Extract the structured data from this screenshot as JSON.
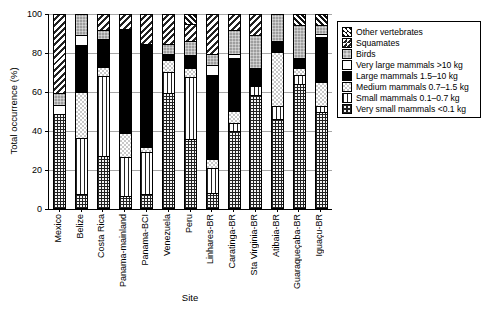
{
  "chart_data": {
    "type": "bar",
    "stacked": true,
    "percent": true,
    "title": "",
    "xlabel": "Site",
    "ylabel": "Total occurrence (%)",
    "ylim": [
      0,
      100
    ],
    "yticks": [
      0,
      20,
      40,
      60,
      80,
      100
    ],
    "grid": true,
    "legend_position": "top-right",
    "categories": [
      "Mexico",
      "Belize",
      "Costa Rica",
      "Panama-mainland",
      "Panama-BCI",
      "Venezuela",
      "Peru",
      "Linhares-BR",
      "Caratinga-BR",
      "Sta Virginia-BR",
      "Atibaia-BR",
      "Guaraqueçaba-BR",
      "Iguaçu-BR"
    ],
    "series": [
      {
        "key": "very_small",
        "name": "Very small mammals <0.1 kg",
        "pattern": "dense-grid-crosshatch",
        "values": [
          48.5,
          7,
          27,
          6,
          7,
          59.5,
          35.5,
          7.5,
          40,
          58.5,
          46,
          64,
          49.5
        ]
      },
      {
        "key": "small",
        "name": "Small mammals 0.1–0.7 kg",
        "pattern": "vertical-lines",
        "values": [
          0,
          29,
          41.5,
          20.5,
          22,
          11,
          32.5,
          13,
          4,
          4.5,
          7,
          5,
          3.5
        ]
      },
      {
        "key": "medium",
        "name": "Medium mammals 0.7–1.5 kg",
        "pattern": "light-checker",
        "values": [
          0,
          24,
          4.5,
          12.5,
          2.5,
          6,
          4.5,
          5,
          6,
          0,
          28,
          3.5,
          12.5
        ]
      },
      {
        "key": "large",
        "name": "Large mammals 1.5–10 kg",
        "pattern": "solid-black",
        "color": "#000000",
        "values": [
          0,
          24.5,
          14.5,
          53.5,
          53.5,
          3.5,
          7,
          43.5,
          27.5,
          9.5,
          5.5,
          5,
          23
        ]
      },
      {
        "key": "very_large",
        "name": "Very large mammals >10 kg",
        "pattern": "solid-white",
        "color": "#ffffff",
        "values": [
          5,
          5,
          0,
          0,
          0,
          0,
          0,
          5,
          2.5,
          0,
          0,
          0,
          1.5
        ]
      },
      {
        "key": "birds",
        "name": "Birds",
        "pattern": "gray-fine-grid",
        "color": "#9e9e9e",
        "values": [
          6,
          10.5,
          4.5,
          0,
          0,
          5,
          7,
          6,
          12,
          17,
          13.5,
          17.5,
          5
        ]
      },
      {
        "key": "squamates",
        "name": "Squamates",
        "pattern": "diagonal-hatch-forward",
        "values": [
          40.5,
          0,
          8,
          7.5,
          15,
          15,
          9,
          20,
          8,
          10.5,
          0,
          0,
          0
        ]
      },
      {
        "key": "other",
        "name": "Other vertebrates",
        "pattern": "diagonal-hatch-back-dense",
        "values": [
          0,
          0,
          0,
          0,
          0,
          0,
          4.5,
          0,
          0,
          0,
          0,
          5,
          5
        ]
      }
    ]
  }
}
